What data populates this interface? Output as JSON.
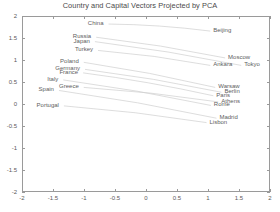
{
  "chart_data": {
    "type": "scatter",
    "title": "Country and Capital Vectors Projected by PCA",
    "xlabel": "",
    "ylabel": "",
    "xlim": [
      -2,
      2
    ],
    "ylim": [
      -2,
      2
    ],
    "xticks": [
      "-2",
      "-1.5",
      "-1",
      "-0.5",
      "0",
      "0.5",
      "1",
      "1.5",
      "2"
    ],
    "xtick_values": [
      -2,
      -1.5,
      -1,
      -0.5,
      0,
      0.5,
      1,
      1.5,
      2
    ],
    "yticks": [
      "2",
      "1.5",
      "1",
      "0.5",
      "0",
      "-0.5",
      "-1",
      "-1.5",
      "-2"
    ],
    "ytick_values": [
      2,
      1.5,
      1,
      0.5,
      0,
      -0.5,
      -1,
      -1.5,
      -2
    ],
    "grid": false,
    "legend": "none",
    "line_color": "#cfcfcf",
    "text_color": "#606060",
    "axis_color": "#9a9a9a",
    "pairs": [
      {
        "country": "China",
        "capital": "Beijing",
        "country_xy": [
          -0.62,
          1.84
        ],
        "capital_xy": [
          1.02,
          1.68
        ]
      },
      {
        "country": "Russia",
        "capital": "Moscow",
        "country_xy": [
          -0.82,
          1.54
        ],
        "capital_xy": [
          1.26,
          1.07
        ]
      },
      {
        "country": "Japan",
        "capital": "Tokyo",
        "country_xy": [
          -0.84,
          1.44
        ],
        "capital_xy": [
          1.52,
          0.9
        ]
      },
      {
        "country": "Turkey",
        "capital": "Ankara",
        "country_xy": [
          -0.79,
          1.24
        ],
        "capital_xy": [
          1.02,
          0.9
        ]
      },
      {
        "country": "Poland",
        "capital": "Warsaw",
        "country_xy": [
          -1.02,
          0.97
        ],
        "capital_xy": [
          1.1,
          0.4
        ]
      },
      {
        "country": "Germany",
        "capital": "Berlin",
        "country_xy": [
          -1.0,
          0.81
        ],
        "capital_xy": [
          1.2,
          0.29
        ]
      },
      {
        "country": "France",
        "capital": "Paris",
        "country_xy": [
          -1.03,
          0.73
        ],
        "capital_xy": [
          1.07,
          0.21
        ]
      },
      {
        "country": "Italy",
        "capital": "Rome",
        "country_xy": [
          -1.35,
          0.57
        ],
        "capital_xy": [
          1.03,
          -0.01
        ]
      },
      {
        "country": "Greece",
        "capital": "Athens",
        "country_xy": [
          -1.02,
          0.4
        ],
        "capital_xy": [
          1.15,
          0.07
        ]
      },
      {
        "country": "Spain",
        "capital": "Madrid",
        "country_xy": [
          -1.42,
          0.33
        ],
        "capital_xy": [
          1.12,
          -0.3
        ]
      },
      {
        "country": "Portugal",
        "capital": "Lisbon",
        "country_xy": [
          -1.34,
          -0.02
        ],
        "capital_xy": [
          0.96,
          -0.4
        ]
      }
    ]
  }
}
